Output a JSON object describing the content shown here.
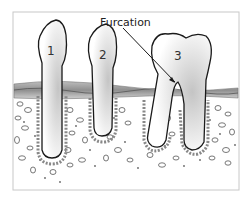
{
  "diagram": {
    "callout": {
      "label": "Furcation"
    },
    "teeth": [
      {
        "number": "1",
        "type": "single-root"
      },
      {
        "number": "2",
        "type": "single-root"
      },
      {
        "number": "3",
        "type": "molar-two-roots"
      }
    ],
    "colors": {
      "frame": "#c8c8c8",
      "outline": "#1a1a1a",
      "gum": "#9a9a9a",
      "gum_light": "#cfcfcf",
      "bone_bg": "#ffffff",
      "shade": "#d9d9d9"
    }
  }
}
